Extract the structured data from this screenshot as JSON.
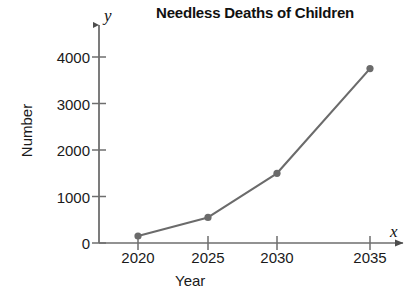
{
  "chart_data": {
    "type": "line",
    "title": "Needless Deaths of Children",
    "xlabel": "Year",
    "ylabel": "Number",
    "x_axis_variable": "x",
    "y_axis_variable": "y",
    "categories": [
      2020,
      2025,
      2030,
      2035
    ],
    "x": [
      2020,
      2025,
      2030,
      2035
    ],
    "values": [
      150,
      550,
      1500,
      3750
    ],
    "series": [
      {
        "name": "Needless Deaths of Children",
        "values": [
          150,
          550,
          1500,
          3750
        ]
      }
    ],
    "xtick_labels": [
      "2020",
      "2025",
      "2030",
      "2035"
    ],
    "ytick_labels": [
      "0",
      "1000",
      "2000",
      "3000",
      "4000"
    ],
    "yticks": [
      0,
      1000,
      2000,
      3000,
      4000
    ],
    "xlim": [
      2018,
      2037
    ],
    "ylim": [
      0,
      4400
    ],
    "grid": false,
    "legend": false,
    "legend_position": "none",
    "marker": "circle",
    "line_color": "#6b6b6b",
    "marker_color": "#6b6b6b",
    "axis_color": "#6e6e6e",
    "text_color": "#1a1a1a",
    "background_color": "#ffffff"
  },
  "axis_labels": {
    "y_axis_title": "Number",
    "x_axis_title": "Year",
    "y_variable": "y",
    "x_variable": "x"
  },
  "title": "Needless Deaths of Children"
}
